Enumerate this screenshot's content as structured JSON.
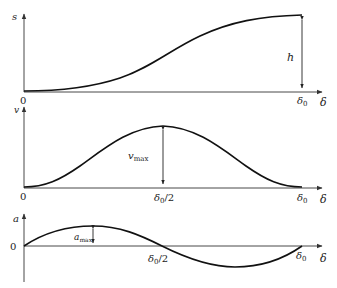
{
  "diagram": {
    "colors": {
      "curve": "#111111",
      "axis": "#333333",
      "text": "#222222",
      "background": "#ffffff"
    },
    "panels": [
      {
        "id": "displacement",
        "y_label": "s",
        "x_label": "δ",
        "origin_label": "0",
        "end_label": "δ0",
        "end_label_main": "δ",
        "end_label_sub": "0",
        "annotation": "h",
        "annotation_desc": "total lift"
      },
      {
        "id": "velocity",
        "y_label": "v",
        "x_label": "δ",
        "mid_label_main": "δ",
        "mid_label_sub": "0",
        "mid_label_tail": "/2",
        "end_label_main": "δ",
        "end_label_sub": "0",
        "annotation_main": "v",
        "annotation_sub": "max"
      },
      {
        "id": "acceleration",
        "y_label": "a",
        "x_label": "δ",
        "origin_label": "0",
        "mid_label_main": "δ",
        "mid_label_sub": "0",
        "mid_label_tail": "/2",
        "end_label_main": "δ",
        "end_label_sub": "0",
        "annotation_main": "a",
        "annotation_sub": "max"
      }
    ]
  }
}
